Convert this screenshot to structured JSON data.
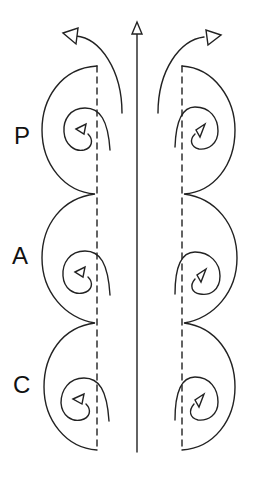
{
  "diagram": {
    "labels": [
      {
        "id": "P",
        "text": "P",
        "x": 14,
        "y": 124
      },
      {
        "id": "A",
        "text": "A",
        "x": 12,
        "y": 244
      },
      {
        "id": "C",
        "text": "C",
        "x": 13,
        "y": 373
      }
    ],
    "colors": {
      "stroke": "#222222",
      "background": "#ffffff"
    },
    "elements": {
      "central_axis": "upward arrow along midline",
      "dashed_lines": 2,
      "segments_per_side": 3,
      "spiral_vortices_per_side": 3,
      "outflow_arrows": 2
    }
  }
}
